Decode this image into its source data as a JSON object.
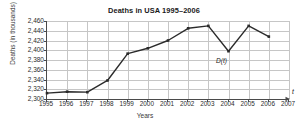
{
  "chart_data": {
    "type": "line",
    "title": "Deaths in USA 1995–2006",
    "xlabel": "Years",
    "ylabel": "Deaths (in thousands)",
    "x": [
      1995,
      1996,
      1997,
      1998,
      1999,
      2000,
      2001,
      2002,
      2003,
      2004,
      2005,
      2006
    ],
    "values": [
      2312,
      2315,
      2314,
      2338,
      2393,
      2404,
      2420,
      2445,
      2450,
      2398,
      2450,
      2428
    ],
    "series": [
      {
        "name": "D(t)",
        "values": [
          2312,
          2315,
          2314,
          2338,
          2393,
          2404,
          2420,
          2445,
          2450,
          2398,
          2450,
          2428
        ]
      }
    ],
    "xlim": [
      1995,
      2007
    ],
    "ylim": [
      2300,
      2460
    ],
    "xticks": [
      "1995",
      "1996",
      "1997",
      "1998",
      "1999",
      "2000",
      "2001",
      "2002",
      "2003",
      "2004",
      "2005",
      "2006",
      "2007"
    ],
    "yticks": [
      "2,300",
      "2,320",
      "2,340",
      "2,360",
      "2,380",
      "2,400",
      "2,420",
      "2,440",
      "2,460"
    ],
    "ytick_values": [
      2300,
      2320,
      2340,
      2360,
      2380,
      2400,
      2420,
      2440,
      2460
    ],
    "grid": true,
    "legend": "none",
    "annotations": [
      {
        "text": "D(t)",
        "x": 2004,
        "y": 2398
      },
      {
        "text": "t",
        "axis": "x-end"
      }
    ],
    "axis_arrow_label": "t",
    "curve_label": "D(t)",
    "line_color": "#2b2b2b",
    "marker_color": "#2b2b2b",
    "grid_color": "#c6c6c6",
    "axis_color": "#4a4a4a",
    "background": "#ffffff"
  }
}
